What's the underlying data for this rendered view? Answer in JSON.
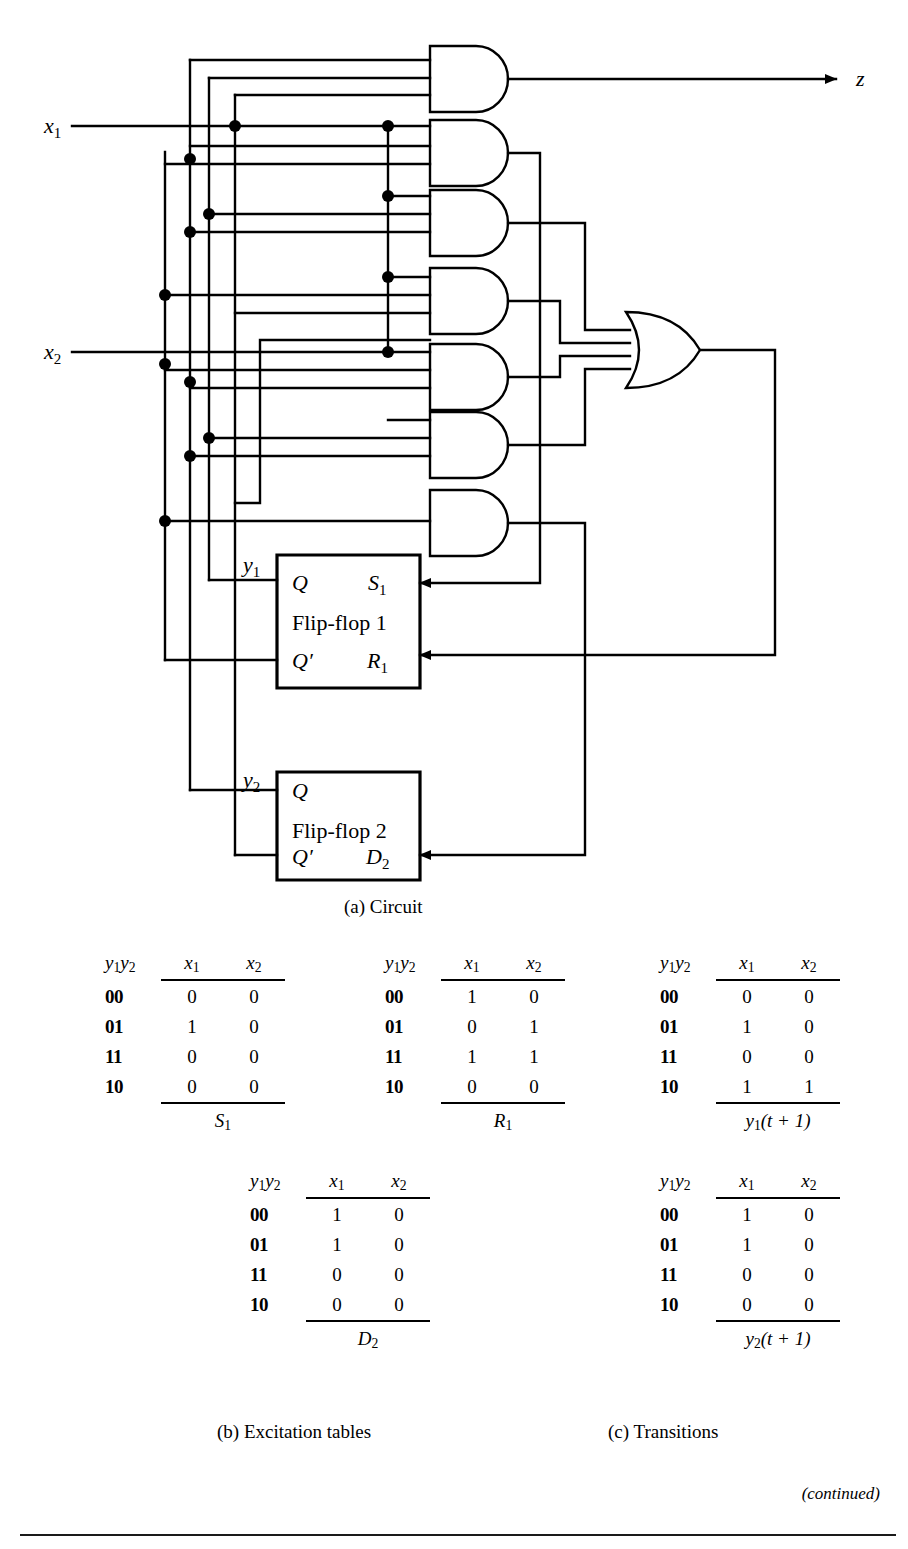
{
  "figure": {
    "caption_a": "(a)  Circuit",
    "caption_b": "(b)  Excitation tables",
    "caption_c": "(c)  Transitions",
    "continued": "(continued)"
  },
  "circuit": {
    "inputs": [
      {
        "name": "x1",
        "label_base": "x",
        "label_sub": "1"
      },
      {
        "name": "x2",
        "label_base": "x",
        "label_sub": "2"
      }
    ],
    "output": {
      "name": "z",
      "label": "z"
    },
    "state_labels": [
      {
        "name": "y1",
        "label_base": "y",
        "label_sub": "1"
      },
      {
        "name": "y2",
        "label_base": "y",
        "label_sub": "2"
      }
    ],
    "and_gate_count": 7,
    "or_gate_count": 1,
    "flipflops": [
      {
        "title": "Flip-flop 1",
        "q_label": "Q",
        "qbar_label": "Q′",
        "input_top_base": "S",
        "input_top_sub": "1",
        "input_bottom_base": "R",
        "input_bottom_sub": "1"
      },
      {
        "title": "Flip-flop 2",
        "q_label": "Q",
        "qbar_label": "Q′",
        "input_top_base": "",
        "input_top_sub": "",
        "input_bottom_base": "D",
        "input_bottom_sub": "2"
      }
    ],
    "line_color": "#000000"
  },
  "tables": [
    {
      "id": "S1",
      "row_header_base": "y",
      "row_header": "y1y2",
      "columns": [
        {
          "base": "x",
          "sub": "1"
        },
        {
          "base": "x",
          "sub": "2"
        }
      ],
      "states": [
        "00",
        "01",
        "11",
        "10"
      ],
      "values": [
        [
          "0",
          "0"
        ],
        [
          "1",
          "0"
        ],
        [
          "0",
          "0"
        ],
        [
          "0",
          "0"
        ]
      ],
      "footer_base": "S",
      "footer_sub": "1",
      "footer_tail": ""
    },
    {
      "id": "R1",
      "row_header": "y1y2",
      "columns": [
        {
          "base": "x",
          "sub": "1"
        },
        {
          "base": "x",
          "sub": "2"
        }
      ],
      "states": [
        "00",
        "01",
        "11",
        "10"
      ],
      "values": [
        [
          "1",
          "0"
        ],
        [
          "0",
          "1"
        ],
        [
          "1",
          "1"
        ],
        [
          "0",
          "0"
        ]
      ],
      "footer_base": "R",
      "footer_sub": "1",
      "footer_tail": ""
    },
    {
      "id": "y1t1",
      "row_header": "y1y2",
      "columns": [
        {
          "base": "x",
          "sub": "1"
        },
        {
          "base": "x",
          "sub": "2"
        }
      ],
      "states": [
        "00",
        "01",
        "11",
        "10"
      ],
      "values": [
        [
          "0",
          "0"
        ],
        [
          "1",
          "0"
        ],
        [
          "0",
          "0"
        ],
        [
          "1",
          "1"
        ]
      ],
      "footer_base": "y",
      "footer_sub": "1",
      "footer_tail": "(t + 1)"
    },
    {
      "id": "D2",
      "row_header": "y1y2",
      "columns": [
        {
          "base": "x",
          "sub": "1"
        },
        {
          "base": "x",
          "sub": "2"
        }
      ],
      "states": [
        "00",
        "01",
        "11",
        "10"
      ],
      "values": [
        [
          "1",
          "0"
        ],
        [
          "1",
          "0"
        ],
        [
          "0",
          "0"
        ],
        [
          "0",
          "0"
        ]
      ],
      "footer_base": "D",
      "footer_sub": "2",
      "footer_tail": ""
    },
    {
      "id": "y2t1",
      "row_header": "y1y2",
      "columns": [
        {
          "base": "x",
          "sub": "1"
        },
        {
          "base": "x",
          "sub": "2"
        }
      ],
      "states": [
        "00",
        "01",
        "11",
        "10"
      ],
      "values": [
        [
          "1",
          "0"
        ],
        [
          "1",
          "0"
        ],
        [
          "0",
          "0"
        ],
        [
          "0",
          "0"
        ]
      ],
      "footer_base": "y",
      "footer_sub": "2",
      "footer_tail": "(t + 1)"
    }
  ]
}
